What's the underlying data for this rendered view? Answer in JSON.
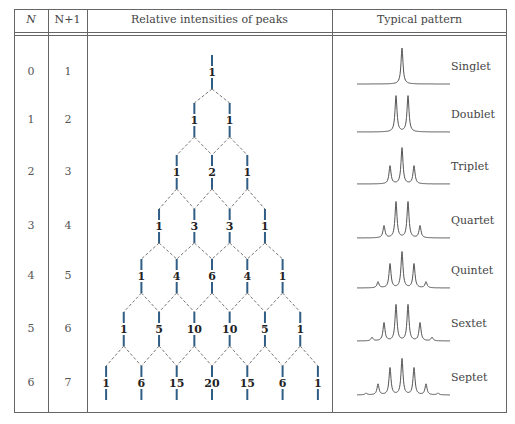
{
  "table": {
    "headers": {
      "n": "N",
      "n_plus_1": "N+1",
      "intensities": "Relative intensities of peaks",
      "pattern": "Typical pattern"
    },
    "rows": [
      {
        "n": "0",
        "n_plus_1": "1",
        "intensities": [
          1
        ],
        "pattern": "Singlet"
      },
      {
        "n": "1",
        "n_plus_1": "2",
        "intensities": [
          1,
          1
        ],
        "pattern": "Doublet"
      },
      {
        "n": "2",
        "n_plus_1": "3",
        "intensities": [
          1,
          2,
          1
        ],
        "pattern": "Triplet"
      },
      {
        "n": "3",
        "n_plus_1": "4",
        "intensities": [
          1,
          3,
          3,
          1
        ],
        "pattern": "Quartet"
      },
      {
        "n": "4",
        "n_plus_1": "5",
        "intensities": [
          1,
          4,
          6,
          4,
          1
        ],
        "pattern": "Quintet"
      },
      {
        "n": "5",
        "n_plus_1": "6",
        "intensities": [
          1,
          5,
          10,
          10,
          5,
          1
        ],
        "pattern": "Sextet"
      },
      {
        "n": "6",
        "n_plus_1": "7",
        "intensities": [
          1,
          6,
          15,
          20,
          15,
          6,
          1
        ],
        "pattern": "Septet"
      }
    ]
  },
  "colors": {
    "border": "#555555",
    "vertical_segment": "#2f5d86",
    "dashed_connector": "#777777",
    "spectrum_line": "#555555",
    "number_text": "#222222"
  }
}
